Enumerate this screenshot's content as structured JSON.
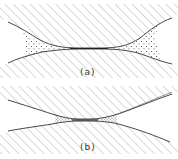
{
  "figure": {
    "panels": [
      {
        "id": "a",
        "label": "(a)",
        "description": "Two hatched solid bodies meeting at a narrow contact; flared gaps on either side filled with a stippled phase",
        "fill_extent": "large"
      },
      {
        "id": "b",
        "label": "(b)",
        "description": "Two hatched solid bodies with narrow gaps; small stippled regions confined near the contact",
        "fill_extent": "small"
      }
    ],
    "colors": {
      "line": "#333333",
      "hatch": "#b8b8b8",
      "stipple": "#444444",
      "background": "#ffffff"
    }
  }
}
